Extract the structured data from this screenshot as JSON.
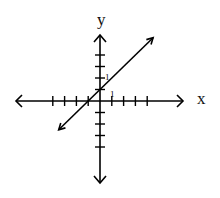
{
  "chart_data": {
    "type": "line",
    "title": "",
    "xlabel": "x",
    "ylabel": "y",
    "xlim": [
      -4,
      4
    ],
    "ylim": [
      -4,
      4
    ],
    "grid": false,
    "x_ticks": [
      -4,
      -3,
      -2,
      -1,
      1,
      2,
      3,
      4
    ],
    "y_ticks": [
      -4,
      -3,
      -2,
      -1,
      1,
      2,
      3,
      4
    ],
    "tick_labels": [
      {
        "axis": "x",
        "value": 1,
        "label": "1"
      },
      {
        "axis": "y",
        "value": 1,
        "label": "1"
      }
    ],
    "series": [
      {
        "name": "y = x + 1",
        "equation": "y = x + 1",
        "slope": 1,
        "intercept": 1,
        "x": [
          -3.5,
          4.5
        ],
        "values": [
          -2.5,
          5.5
        ],
        "arrows_both_ends": true
      }
    ],
    "color": "#000000"
  },
  "labels": {
    "x_axis": "x",
    "y_axis": "y",
    "x_tick_one": "1",
    "y_tick_one": "1"
  }
}
